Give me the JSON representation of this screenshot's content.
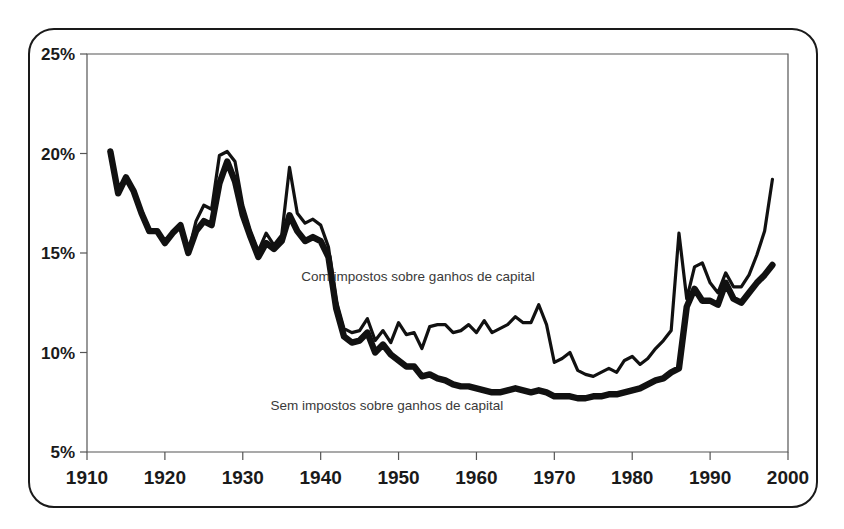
{
  "top_caption": "de 1% mais ricos",
  "figure": {
    "frame_label": "chart-frame"
  },
  "chart_data": {
    "type": "line",
    "title": "",
    "subtitle": "",
    "xlabel": "",
    "ylabel": "",
    "xlim": [
      1910,
      2000
    ],
    "ylim": [
      5,
      25
    ],
    "xticks": [
      1910,
      1920,
      1930,
      1940,
      1950,
      1960,
      1970,
      1980,
      1990,
      2000
    ],
    "xtick_labels": [
      "1910",
      "1920",
      "1930",
      "1940",
      "1950",
      "1960",
      "1970",
      "1980",
      "1990",
      "2000"
    ],
    "yticks": [
      5,
      10,
      15,
      20,
      25
    ],
    "ytick_labels": [
      "5%",
      "10%",
      "15%",
      "20%",
      "25%"
    ],
    "grid": false,
    "legend_position": "inline-annotation",
    "y_unit": "%",
    "annotations": [
      {
        "text": "Com impostos sobre ganhos de capital",
        "x": 1952.5,
        "y": 13.6,
        "series": "com_ganhos_capital"
      },
      {
        "text": "Sem impostos sobre ganhos de capital",
        "x": 1948.5,
        "y": 7.1,
        "series": "sem_ganhos_capital"
      }
    ],
    "x": [
      1913,
      1914,
      1915,
      1916,
      1917,
      1918,
      1919,
      1920,
      1921,
      1922,
      1923,
      1924,
      1925,
      1926,
      1927,
      1928,
      1929,
      1930,
      1931,
      1932,
      1933,
      1934,
      1935,
      1936,
      1937,
      1938,
      1939,
      1940,
      1941,
      1942,
      1943,
      1944,
      1945,
      1946,
      1947,
      1948,
      1949,
      1950,
      1951,
      1952,
      1953,
      1954,
      1955,
      1956,
      1957,
      1958,
      1959,
      1960,
      1961,
      1962,
      1963,
      1964,
      1965,
      1966,
      1967,
      1968,
      1969,
      1970,
      1971,
      1972,
      1973,
      1974,
      1975,
      1976,
      1977,
      1978,
      1979,
      1980,
      1981,
      1982,
      1983,
      1984,
      1985,
      1986,
      1987,
      1988,
      1989,
      1990,
      1991,
      1992,
      1993,
      1994,
      1995,
      1996,
      1997,
      1998
    ],
    "series": [
      {
        "name": "Com impostos sobre ganhos de capital",
        "style": "thin",
        "color": "#111111",
        "values": [
          20.1,
          18.0,
          18.8,
          18.1,
          17.0,
          16.1,
          16.1,
          15.5,
          16.0,
          16.4,
          15.0,
          16.6,
          17.4,
          17.2,
          19.9,
          20.1,
          19.6,
          17.4,
          16.1,
          15.1,
          16.0,
          15.4,
          15.9,
          19.3,
          17.0,
          16.5,
          16.7,
          16.4,
          15.3,
          12.6,
          11.2,
          11.0,
          11.1,
          11.7,
          10.6,
          11.1,
          10.5,
          11.5,
          10.9,
          11.0,
          10.2,
          11.3,
          11.4,
          11.4,
          11.0,
          11.1,
          11.4,
          11.0,
          11.6,
          11.0,
          11.2,
          11.4,
          11.8,
          11.5,
          11.5,
          12.4,
          11.4,
          9.5,
          9.7,
          10.0,
          9.1,
          8.9,
          8.8,
          9.0,
          9.2,
          9.0,
          9.6,
          9.8,
          9.4,
          9.7,
          10.2,
          10.6,
          11.1,
          16.0,
          12.7,
          14.3,
          14.5,
          13.5,
          13.0,
          14.0,
          13.3,
          13.3,
          13.9,
          14.9,
          16.1,
          18.7
        ]
      },
      {
        "name": "Sem impostos sobre ganhos de capital",
        "style": "thick",
        "color": "#111111",
        "values": [
          20.1,
          18.0,
          18.8,
          18.1,
          17.0,
          16.1,
          16.1,
          15.5,
          16.0,
          16.4,
          15.0,
          16.1,
          16.6,
          16.4,
          18.5,
          19.6,
          18.6,
          16.9,
          15.8,
          14.8,
          15.5,
          15.2,
          15.6,
          16.9,
          16.1,
          15.6,
          15.8,
          15.6,
          14.8,
          12.2,
          10.8,
          10.5,
          10.6,
          11.0,
          10.0,
          10.4,
          9.9,
          9.6,
          9.3,
          9.3,
          8.8,
          8.9,
          8.7,
          8.6,
          8.4,
          8.3,
          8.3,
          8.2,
          8.1,
          8.0,
          8.0,
          8.1,
          8.2,
          8.1,
          8.0,
          8.1,
          8.0,
          7.8,
          7.8,
          7.8,
          7.7,
          7.7,
          7.8,
          7.8,
          7.9,
          7.9,
          8.0,
          8.1,
          8.2,
          8.4,
          8.6,
          8.7,
          9.0,
          9.2,
          12.3,
          13.2,
          12.6,
          12.6,
          12.4,
          13.5,
          12.7,
          12.5,
          13.0,
          13.5,
          13.9,
          14.4
        ]
      }
    ]
  }
}
